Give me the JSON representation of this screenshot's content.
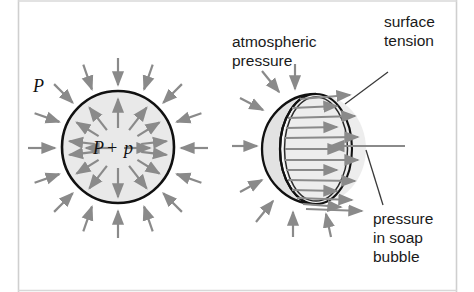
{
  "figure": {
    "background_color": "#ffffff",
    "border_color": "#c9c9c9",
    "arrow_color": "#8a8a8a",
    "outline_color": "#111111",
    "fill_color": "#e9e9e9",
    "text_color": "#1a1a1a"
  },
  "left_panel": {
    "name": "spherical-bubble-cross-section",
    "outside_pressure_label": "P",
    "inside_pressure_label": "P + p",
    "inside_pressure_parts": {
      "symbol_major": "P",
      "operator": "+",
      "symbol_minor": "p"
    },
    "circle": {
      "cx": 118,
      "cy": 147,
      "r": 56
    },
    "inward_arrow_count": 16,
    "outward_arrow_count": 16
  },
  "right_panel": {
    "name": "cutaway-soap-bubble",
    "labels": {
      "atmospheric_pressure": [
        "atmospheric",
        "pressure"
      ],
      "surface_tension": [
        "surface",
        "tension"
      ],
      "pressure_in_soap_bubble": [
        "pressure",
        "in soap",
        "bubble"
      ]
    },
    "sphere": {
      "cx": 316,
      "cy": 149,
      "rx": 36,
      "ry": 55
    },
    "inward_arrow_count": 8,
    "outward_arrow_count": 13
  }
}
